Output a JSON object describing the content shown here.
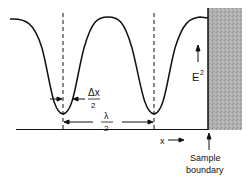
{
  "figure": {
    "labels": {
      "delta_x_num": "Δx",
      "delta_x_den": "2",
      "lambda_num": "λ",
      "lambda_den": "2",
      "e_squared": "E",
      "e_squared_exp": "2",
      "x_axis": "x",
      "sample_line1": "Sample",
      "sample_line2": "boundary"
    },
    "colors": {
      "line": "#111111",
      "sample_fill": "#a8a8a8"
    }
  }
}
